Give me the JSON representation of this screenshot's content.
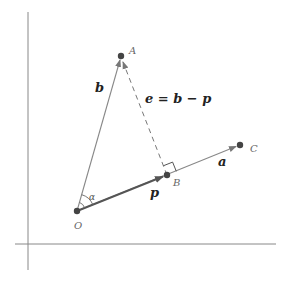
{
  "diagram": {
    "points": {
      "O": {
        "label": "O",
        "x": 77,
        "y": 211
      },
      "A": {
        "label": "A",
        "x": 121,
        "y": 56
      },
      "B": {
        "label": "B",
        "x": 167,
        "y": 175
      },
      "C": {
        "label": "C",
        "x": 240,
        "y": 145
      }
    },
    "vectors": {
      "a": {
        "label": "a"
      },
      "b": {
        "label": "b"
      },
      "p": {
        "label": "p"
      },
      "e": {
        "label": "e = b − p"
      }
    },
    "angle": {
      "label": "α"
    },
    "colors": {
      "axis": "#888888",
      "line": "#777777",
      "vector_p": "#555555",
      "point": "#444444",
      "dashed": "#777777"
    }
  }
}
